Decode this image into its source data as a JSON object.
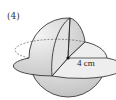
{
  "figure": {
    "label": "(4)",
    "dimension": {
      "text": "4 cm",
      "quantity": "radius"
    }
  },
  "colors": {
    "sphere_fill": "#d9d9d9",
    "cut_face_fill": "#ececec",
    "lower_fill": "#cfcfcf",
    "stroke": "#222222"
  }
}
